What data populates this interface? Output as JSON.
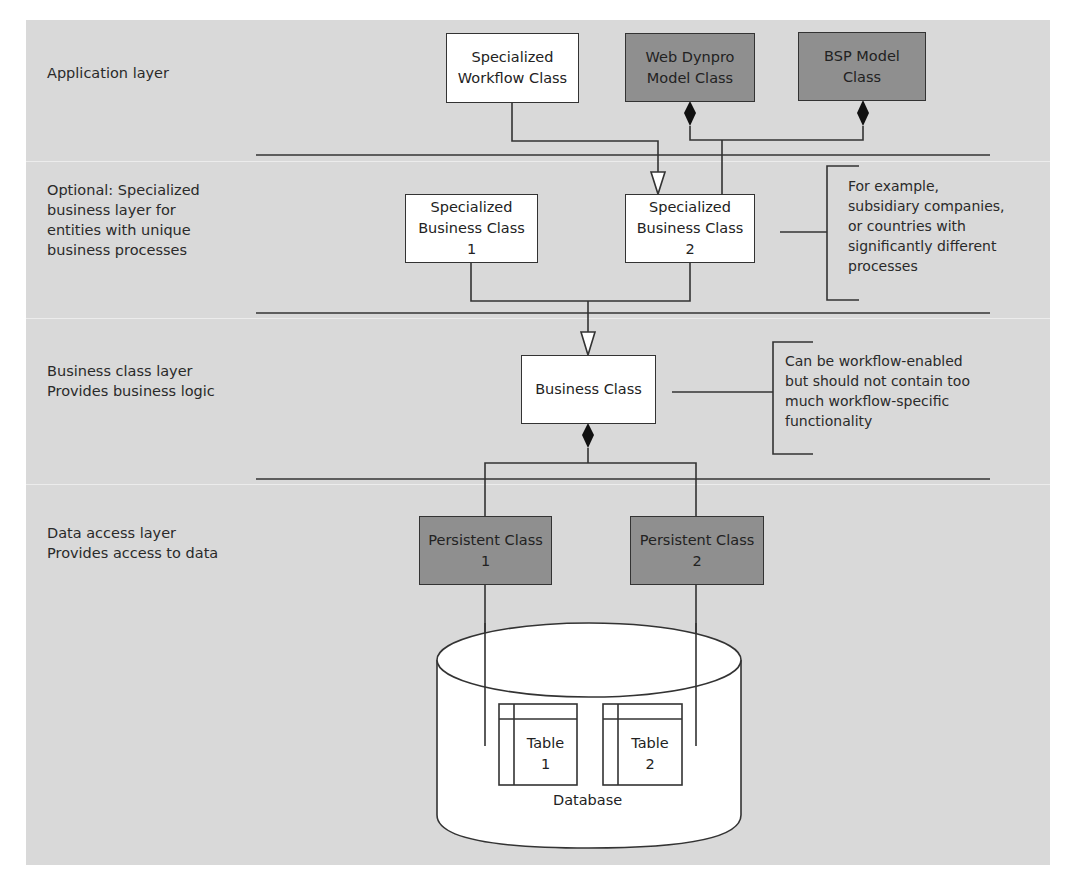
{
  "colors": {
    "panel_background": "#d9d9d9",
    "class_white": "#ffffff",
    "class_dark": "#8f8f8f",
    "line": "#333333"
  },
  "layers": [
    {
      "id": "application",
      "label": "Application layer"
    },
    {
      "id": "specialized-business",
      "label": "Optional: Specialized\nbusiness layer for\nentities with unique\nbusiness processes"
    },
    {
      "id": "business-class",
      "label": "Business class layer\nProvides business logic"
    },
    {
      "id": "data-access",
      "label": "Data access layer\nProvides access to data"
    }
  ],
  "classes": {
    "specialized_workflow": {
      "label": "Specialized\nWorkflow Class",
      "style": "white"
    },
    "web_dynpro_model": {
      "label": "Web Dynpro\nModel Class",
      "style": "dark"
    },
    "bsp_model": {
      "label": "BSP Model\nClass",
      "style": "dark"
    },
    "specialized_business_1": {
      "label": "Specialized\nBusiness Class\n1",
      "style": "white"
    },
    "specialized_business_2": {
      "label": "Specialized\nBusiness Class\n2",
      "style": "white"
    },
    "business": {
      "label": "Business Class",
      "style": "white"
    },
    "persistent_1": {
      "label": "Persistent Class\n1",
      "style": "dark"
    },
    "persistent_2": {
      "label": "Persistent Class\n2",
      "style": "dark"
    }
  },
  "notes": {
    "specialized_business": "For example,\nsubsidiary companies,\nor countries with\nsignificantly different\nprocesses",
    "business_class": "Can be workflow-enabled\nbut should not contain too\nmuch workflow-specific\nfunctionality"
  },
  "database": {
    "label": "Database",
    "tables": [
      {
        "label": "Table\n1"
      },
      {
        "label": "Table\n2"
      }
    ]
  },
  "relations": [
    {
      "from": "specialized_workflow",
      "to": "specialized_business_2",
      "type": "generalization"
    },
    {
      "from": "web_dynpro_model",
      "to": "specialized_business_2",
      "type": "composition"
    },
    {
      "from": "bsp_model",
      "to": "specialized_business_2",
      "type": "composition"
    },
    {
      "from": "specialized_business_1",
      "to": "business",
      "type": "generalization"
    },
    {
      "from": "specialized_business_2",
      "to": "business",
      "type": "generalization"
    },
    {
      "from": "business",
      "to": "persistent_1",
      "type": "composition"
    },
    {
      "from": "business",
      "to": "persistent_2",
      "type": "composition"
    },
    {
      "from": "persistent_1",
      "to": "table_1",
      "type": "association"
    },
    {
      "from": "persistent_2",
      "to": "table_2",
      "type": "association"
    }
  ]
}
